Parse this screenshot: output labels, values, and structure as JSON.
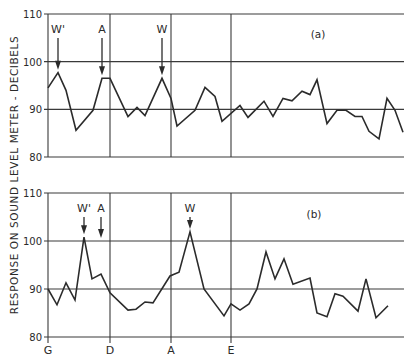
{
  "ylabel": "RESPONSE ON SOUND LEVEL METER - DECIBELS",
  "x_labels": [
    {
      "label": "G",
      "x": 48
    },
    {
      "label": "D",
      "x": 110
    },
    {
      "label": "A",
      "x": 171
    },
    {
      "label": "E",
      "x": 231
    }
  ],
  "chart_data": [
    {
      "type": "line",
      "title": "(a)",
      "panel": "a",
      "ylabel": "Response on sound level meter - decibels",
      "ylim": [
        80,
        110
      ],
      "yticks": [
        80,
        90,
        100,
        110
      ],
      "x_reference_labels": [
        "G",
        "D",
        "A",
        "E"
      ],
      "grid": true,
      "annotations": [
        {
          "label": "W'",
          "x": 58,
          "points_to": 97.7
        },
        {
          "label": "A",
          "x": 102,
          "points_to": 96.5
        },
        {
          "label": "W",
          "x": 162,
          "points_to": 96.5
        }
      ],
      "x": [
        48,
        58,
        66,
        76,
        93,
        102,
        110,
        128,
        137,
        145,
        162,
        171,
        177,
        195,
        205,
        215,
        222,
        240,
        248,
        264,
        273,
        283,
        292,
        302,
        310,
        317,
        327,
        337,
        346,
        355,
        362,
        369,
        379,
        387,
        395,
        403
      ],
      "values": [
        94.5,
        97.7,
        94.0,
        85.6,
        89.8,
        96.5,
        96.5,
        88.5,
        90.4,
        88.7,
        96.5,
        92.3,
        86.5,
        89.8,
        94.6,
        92.7,
        87.5,
        90.8,
        88.3,
        91.7,
        88.5,
        92.3,
        91.8,
        93.8,
        93.1,
        96.2,
        87.0,
        89.8,
        89.8,
        88.5,
        88.5,
        85.4,
        83.8,
        92.3,
        89.8,
        85.2
      ]
    },
    {
      "type": "line",
      "title": "(b)",
      "panel": "b",
      "ylabel": "Response on sound level meter - decibels",
      "ylim": [
        80,
        110
      ],
      "yticks": [
        80,
        90,
        100,
        110
      ],
      "x_reference_labels": [
        "G",
        "D",
        "A",
        "E"
      ],
      "grid": true,
      "annotations": [
        {
          "label": "W'",
          "x": 84,
          "points_to": 100.8
        },
        {
          "label": "A",
          "x": 101,
          "points_to": 100
        },
        {
          "label": "W",
          "x": 190,
          "points_to": 101.9
        }
      ],
      "x": [
        48,
        57,
        66,
        75,
        84,
        92,
        101,
        110,
        128,
        136,
        145,
        153,
        170,
        179,
        190,
        204,
        224,
        231,
        240,
        249,
        257,
        266,
        275,
        284,
        293,
        310,
        317,
        327,
        335,
        343,
        358,
        366,
        376,
        388
      ],
      "values": [
        90.0,
        86.7,
        91.3,
        87.7,
        100.8,
        92.1,
        93.1,
        89.2,
        85.6,
        85.8,
        87.3,
        87.1,
        92.7,
        93.5,
        101.9,
        90.0,
        84.4,
        86.9,
        85.6,
        86.9,
        90.0,
        97.7,
        92.1,
        96.3,
        91.0,
        92.3,
        85.0,
        84.2,
        89.0,
        88.5,
        85.4,
        92.1,
        84.0,
        86.5
      ]
    }
  ],
  "colors": {
    "line": "#2b2b2b",
    "grid": "#3a3a3a",
    "background": "#ffffff"
  }
}
